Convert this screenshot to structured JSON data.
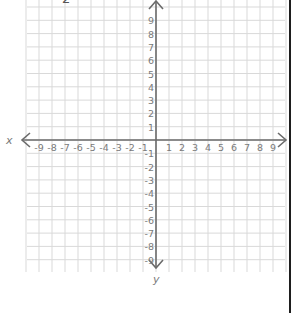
{
  "diagram": {
    "type": "coordinate-plane",
    "x_axis_label": "x",
    "y_axis_label": "y",
    "x_ticks": [
      "-9",
      "-8",
      "-7",
      "-6",
      "-5",
      "-4",
      "-3",
      "-2",
      "-1",
      "1",
      "2",
      "3",
      "4",
      "5",
      "6",
      "7",
      "8",
      "9"
    ],
    "y_ticks_positive": [
      "9",
      "8",
      "7",
      "6",
      "5",
      "4",
      "3",
      "2",
      "1"
    ],
    "y_ticks_negative": [
      "-1",
      "-2",
      "-3",
      "-4",
      "-5",
      "-6",
      "-7",
      "-8",
      "-9"
    ],
    "x_range": [
      -9,
      9
    ],
    "y_range": [
      -9,
      9
    ],
    "grid": true,
    "top_fragment_text": "2"
  },
  "colors": {
    "grid": "#d9d9d9",
    "axis": "#6b6b6b",
    "tick_text": "#7a7a7a",
    "border": "#1e1e1e"
  }
}
